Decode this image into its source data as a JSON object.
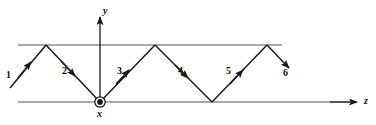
{
  "figure": {
    "background_color": "#ffffff",
    "line_color": "#1a1a1a",
    "boundary_color": "#555555",
    "width": 376,
    "height": 125
  },
  "axes": {
    "vertical": {
      "label": "y",
      "direction": "up",
      "x": 100,
      "y_top": 16,
      "y_bottom": 102
    },
    "horizontal": {
      "label": "z",
      "direction": "right",
      "y": 102,
      "x_start": 18,
      "x_end": 358
    },
    "origin_symbol": {
      "label": "x",
      "meaning": "out-of-page-vector",
      "x": 100,
      "y": 102
    }
  },
  "boundaries": {
    "upper": {
      "y": 45,
      "x_start": 18,
      "x_end": 282
    },
    "lower": {
      "y": 102,
      "x_start": 18,
      "x_end": 358
    }
  },
  "ray": {
    "vertices": [
      {
        "x": 10,
        "y": 88
      },
      {
        "x": 46,
        "y": 45
      },
      {
        "x": 100,
        "y": 102
      },
      {
        "x": 155,
        "y": 45
      },
      {
        "x": 212,
        "y": 102
      },
      {
        "x": 267,
        "y": 45
      },
      {
        "x": 290,
        "y": 70
      }
    ],
    "segments": [
      {
        "label": "1",
        "direction": "up-right",
        "label_x": 6,
        "label_y": 70,
        "arrow_t": 0.55
      },
      {
        "label": "2",
        "direction": "down-right",
        "label_x": 62,
        "label_y": 66,
        "arrow_t": 0.45
      },
      {
        "label": "3",
        "direction": "up-right",
        "label_x": 117,
        "label_y": 66,
        "arrow_t": 0.4
      },
      {
        "label": "4",
        "direction": "down-right",
        "label_x": 178,
        "label_y": 66,
        "arrow_t": 0.38
      },
      {
        "label": "5",
        "direction": "up-right",
        "label_x": 226,
        "label_y": 66,
        "arrow_t": 0.4
      },
      {
        "label": "6",
        "direction": "down-right",
        "label_x": 283,
        "label_y": 68,
        "arrow_t": 0.95
      }
    ]
  }
}
